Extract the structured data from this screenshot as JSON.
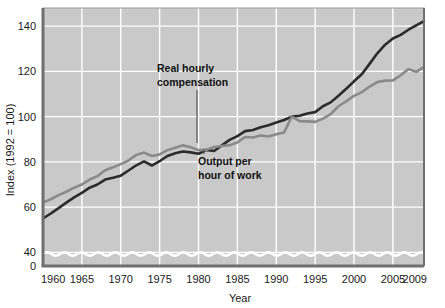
{
  "chart_data": {
    "type": "line",
    "title": "",
    "subtitle": "",
    "xlabel": "Year",
    "ylabel": "Index (1992 = 100)",
    "xlim": [
      1960,
      2009
    ],
    "ylim": [
      34,
      148
    ],
    "xticks": [
      1960,
      1965,
      1970,
      1975,
      1980,
      1985,
      1990,
      1995,
      2000,
      2005,
      2009
    ],
    "xticklabels": [
      "1960",
      "1965",
      "1970",
      "1975",
      "1980",
      "1985",
      "1990",
      "1995",
      "2000",
      "2005",
      "2009"
    ],
    "yticks": [
      0,
      40,
      60,
      80,
      100,
      120,
      140
    ],
    "yticklabels": [
      "0",
      "40",
      "60",
      "80",
      "100",
      "120",
      "140"
    ],
    "grid": true,
    "grid_color": "#ffffff",
    "plot_background": "#c9c9c9",
    "axis_break": true,
    "legend_position": "inline-annotations",
    "x": [
      1960,
      1961,
      1962,
      1963,
      1964,
      1965,
      1966,
      1967,
      1968,
      1969,
      1970,
      1971,
      1972,
      1973,
      1974,
      1975,
      1976,
      1977,
      1978,
      1979,
      1980,
      1981,
      1982,
      1983,
      1984,
      1985,
      1986,
      1987,
      1988,
      1989,
      1990,
      1991,
      1992,
      1993,
      1994,
      1995,
      1996,
      1997,
      1998,
      1999,
      2000,
      2001,
      2002,
      2003,
      2004,
      2005,
      2006,
      2007,
      2008,
      2009
    ],
    "series": [
      {
        "name": "Output per hour of work",
        "color": "#2b2b2b",
        "linewidth": 2.6,
        "values": [
          55.0,
          57.2,
          59.6,
          62.0,
          64.3,
          66.3,
          68.6,
          70.0,
          72.2,
          73.0,
          73.9,
          76.2,
          78.5,
          80.2,
          78.4,
          80.3,
          82.6,
          83.8,
          84.6,
          84.2,
          83.6,
          85.3,
          84.8,
          87.3,
          89.7,
          91.4,
          93.6,
          94.1,
          95.3,
          96.2,
          97.4,
          98.5,
          100.0,
          100.4,
          101.4,
          102.0,
          104.6,
          106.3,
          109.2,
          112.3,
          115.6,
          118.7,
          123.3,
          128.0,
          131.8,
          134.5,
          136.1,
          138.4,
          140.3,
          142.2
        ]
      },
      {
        "name": "Real hourly compensation",
        "color": "#8a8a8a",
        "linewidth": 2.6,
        "values": [
          62.0,
          63.5,
          65.3,
          66.8,
          68.6,
          70.0,
          72.2,
          73.7,
          76.3,
          77.6,
          79.0,
          80.6,
          83.1,
          84.1,
          82.6,
          83.3,
          85.2,
          86.3,
          87.3,
          86.5,
          85.2,
          85.3,
          86.6,
          87.0,
          87.4,
          88.6,
          91.0,
          90.8,
          91.7,
          91.2,
          92.2,
          93.0,
          100.0,
          98.0,
          97.9,
          97.7,
          99.1,
          101.1,
          104.6,
          106.8,
          109.2,
          110.8,
          113.3,
          115.3,
          115.9,
          116.0,
          118.3,
          121.0,
          119.8,
          122.0
        ]
      }
    ],
    "annotations": [
      {
        "name": "real-hourly-compensation",
        "lines": [
          "Real hourly",
          "compensation"
        ],
        "text": "Real hourly compensation",
        "target_year": 1983,
        "target_value": 87.0
      },
      {
        "name": "output-per-hour-of-work",
        "lines": [
          "Output per",
          "hour of work"
        ],
        "text": "Output per hour of work",
        "target_year": 1983,
        "target_value": 87.3
      }
    ]
  }
}
